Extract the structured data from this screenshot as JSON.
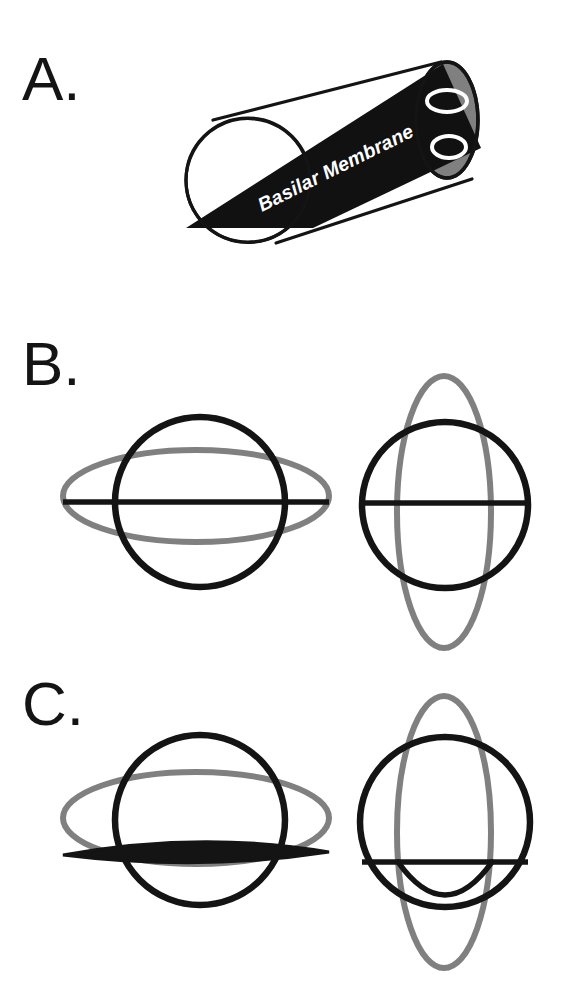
{
  "figure": {
    "width": 561,
    "height": 993,
    "background_color": "#ffffff"
  },
  "colors": {
    "black": "#141414",
    "gray": "#808080",
    "cap_fill": "#808080",
    "white": "#ffffff",
    "membrane_fill": "#111111"
  },
  "panels": [
    {
      "id": "A",
      "label": "A.",
      "label_x": 22,
      "label_y": 100,
      "description": "Three-dimensional cylinder representing the cochlear duct cut open to show the basilar membrane running along its length.",
      "cylinder": {
        "near_face": {
          "cx": 248,
          "cy": 180,
          "r": 62
        },
        "far_cap": {
          "cx": 447,
          "cy": 120,
          "rx": 31,
          "ry": 58
        },
        "top_edge": [
          213,
          120,
          441,
          62
        ],
        "bottom_edge": [
          276,
          242,
          470,
          180
        ],
        "membrane_band_points": "186,228 309,227 478,146 441,64",
        "cap_inner_ellipses": [
          {
            "cx": 447,
            "cy": 101,
            "rx": 20,
            "ry": 11,
            "name": "scala-vestibuli"
          },
          {
            "cx": 447,
            "cy": 146,
            "rx": 17,
            "ry": 11,
            "name": "scala-tympani"
          }
        ]
      },
      "membrane_label": {
        "text": "Basilar Membrane",
        "x": 258,
        "y": 208,
        "rotation_deg": -26.5,
        "color": "#ffffff"
      }
    },
    {
      "id": "B",
      "label": "B.",
      "label_x": 22,
      "label_y": 385,
      "description": "Undeformed cross sections. Left: transverse view with wide horizontal gray ellipse. Right: longitudinal view with tall vertical gray ellipse. The straight black line is the undeformed basilar membrane.",
      "left": {
        "circle": {
          "cx": 200,
          "cy": 502,
          "r": 85
        },
        "gray_ellipse": {
          "cx": 196,
          "cy": 496,
          "rx": 133,
          "ry": 46
        },
        "membrane_line": {
          "x1": 63,
          "y1": 502,
          "x2": 329,
          "y2": 502
        },
        "membrane_state": "flat"
      },
      "right": {
        "circle": {
          "cx": 445,
          "cy": 505,
          "r": 83
        },
        "gray_ellipse": {
          "cx": 444,
          "cy": 512,
          "rx": 47,
          "ry": 136
        },
        "membrane_line": {
          "x1": 362,
          "y1": 503,
          "x2": 528,
          "y2": 503
        },
        "membrane_state": "flat"
      }
    },
    {
      "id": "C",
      "label": "C.",
      "label_x": 22,
      "label_y": 725,
      "description": "Deformed cross sections. The gray ellipses are displaced downward and the black basilar membrane bows downward, shown as a thin lens on the left and a sagging arc on the right.",
      "left": {
        "circle": {
          "cx": 200,
          "cy": 820,
          "r": 85
        },
        "gray_ellipse": {
          "cx": 196,
          "cy": 818,
          "rx": 133,
          "ry": 46
        },
        "membrane_lens_top": "M 63,855 Q 200,832 329,853",
        "membrane_lens_bottom": "M 63,855 Q 200,867 329,853",
        "membrane_state": "bowed-downward"
      },
      "right": {
        "circle": {
          "cx": 445,
          "cy": 822,
          "r": 85
        },
        "gray_ellipse": {
          "cx": 444,
          "cy": 832,
          "rx": 47,
          "ry": 136
        },
        "membrane_line": {
          "x1": 362,
          "y1": 862,
          "x2": 528,
          "y2": 862
        },
        "membrane_arc": "M 398,862 Q 445,925 492,862",
        "membrane_state": "sagging-arc"
      }
    }
  ],
  "legend_note": {
    "black_meaning": "basilar membrane / duct outline",
    "gray_meaning": "deformed fluid-space boundary"
  }
}
